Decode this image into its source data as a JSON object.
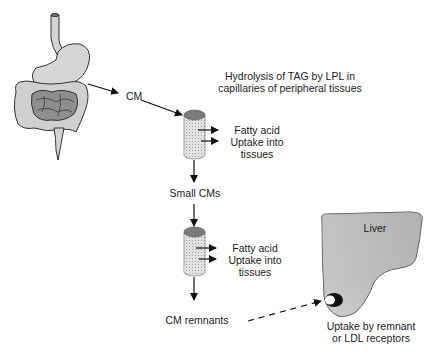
{
  "diagram": {
    "type": "metabolic-pathway",
    "labels": {
      "cm": "CM",
      "hydrolysis_line1": "Hydrolysis of TAG by LPL in",
      "hydrolysis_line2": "capillaries of peripheral tissues",
      "fatty_acid_1": "Fatty acid",
      "uptake_1_line1": "Uptake into",
      "uptake_1_line2": "tissues",
      "small_cms": "Small CMs",
      "fatty_acid_2": "Fatty acid",
      "uptake_2_line1": "Uptake into",
      "uptake_2_line2": "tissues",
      "cm_remnants": "CM remnants",
      "liver": "Liver",
      "receptor_line1": "Uptake by remnant",
      "receptor_line2": "or LDL receptors"
    },
    "nodes": [
      "Digestive tract",
      "CM",
      "Capillary (LPL)",
      "Small CMs",
      "Capillary (LPL)",
      "CM remnants",
      "Liver"
    ],
    "edges": [
      {
        "from": "Digestive tract",
        "to": "CM",
        "style": "solid"
      },
      {
        "from": "CM",
        "to": "Capillary 1",
        "style": "solid"
      },
      {
        "from": "Capillary 1",
        "to": "Small CMs",
        "style": "solid"
      },
      {
        "from": "Small CMs",
        "to": "Capillary 2",
        "style": "solid"
      },
      {
        "from": "Capillary 2",
        "to": "CM remnants",
        "style": "solid"
      },
      {
        "from": "CM remnants",
        "to": "Liver receptor",
        "style": "dashed"
      }
    ],
    "colors": {
      "organ_fill": "#d4d4d4",
      "intestine_dark": "#8e8e8e",
      "cylinder_top": "#7a7a7a",
      "cylinder_body": "#d8d8d8",
      "liver_fill": "#b8b8b8",
      "stroke": "#222222"
    }
  }
}
